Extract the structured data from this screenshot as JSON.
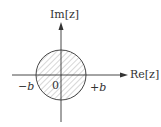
{
  "diagram": {
    "axes": {
      "x_label": "Re[z]",
      "y_label": "Im[z]"
    },
    "ticks": {
      "neg": "−b",
      "origin": "0",
      "pos": "+b"
    },
    "region": {
      "shape": "disk",
      "center": [
        0,
        0
      ],
      "radius_label": "b",
      "fill_pattern": "diagonal-hatch"
    },
    "colors": {
      "line": "#333333",
      "hatch": "#666666",
      "background": "#ffffff"
    }
  }
}
